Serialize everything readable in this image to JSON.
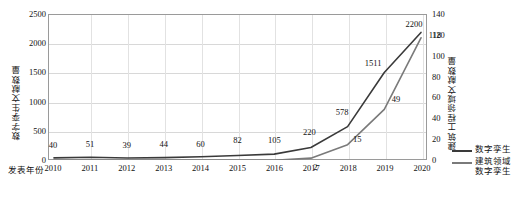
{
  "chart_data": {
    "type": "line",
    "title": "",
    "xlabel": "发表年份",
    "ylabel": "数字孪生文献数量",
    "y2label": "建筑工程领域文献数量",
    "categories": [
      "2010",
      "2011",
      "2012",
      "2013",
      "2014",
      "2015",
      "2016",
      "2017",
      "2018",
      "2019",
      "2020"
    ],
    "ylim": [
      0,
      2500
    ],
    "y2lim": [
      0,
      140
    ],
    "yticks": [
      "0",
      "500",
      "1000",
      "1500",
      "2000",
      "2500"
    ],
    "y2ticks": [
      "0",
      "20",
      "40",
      "60",
      "80",
      "100",
      "120",
      "140"
    ],
    "grid": true,
    "legend_position": "right",
    "series": [
      {
        "name": "数字孪生",
        "axis": "left",
        "color": "#3a3a3a",
        "values": [
          40,
          51,
          39,
          44,
          60,
          82,
          105,
          220,
          578,
          1511,
          2200
        ],
        "labels": [
          "40",
          "51",
          "39",
          "44",
          "60",
          "82",
          "105",
          "220",
          "578",
          "1511",
          "2200"
        ]
      },
      {
        "name": "建筑领域\n数字孪生",
        "axis": "right",
        "color": "#7a7a7a",
        "values": [
          0,
          0,
          0,
          0,
          0,
          0,
          0,
          2,
          15,
          49,
          118
        ],
        "labels": [
          "",
          "",
          "",
          "",
          "",
          "",
          "",
          "2",
          "15",
          "49",
          "118"
        ]
      }
    ]
  },
  "legend": {
    "items": [
      {
        "label": "数字孪生",
        "color": "#3a3a3a"
      },
      {
        "label": "建筑领域\n数字孪生",
        "color": "#7a7a7a"
      }
    ]
  }
}
